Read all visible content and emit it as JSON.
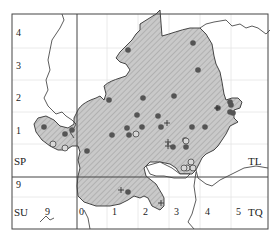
{
  "map": {
    "type": "distribution-map",
    "grid_squares": [
      "SP",
      "TL",
      "SU",
      "TQ"
    ],
    "square_labels": [
      {
        "text": "SP",
        "x": 14,
        "y": 165
      },
      {
        "text": "TL",
        "x": 248,
        "y": 165
      },
      {
        "text": "SU",
        "x": 14,
        "y": 216
      },
      {
        "text": "TQ",
        "x": 248,
        "y": 216
      }
    ],
    "y_ticks": [
      {
        "text": "4",
        "x": 16,
        "y": 37
      },
      {
        "text": "3",
        "x": 16,
        "y": 70
      },
      {
        "text": "2",
        "x": 16,
        "y": 102
      },
      {
        "text": "1",
        "x": 16,
        "y": 135
      },
      {
        "text": "9",
        "x": 16,
        "y": 189
      }
    ],
    "x_ticks": [
      {
        "text": "9",
        "x": 45,
        "y": 216
      },
      {
        "text": "0",
        "x": 79,
        "y": 216
      },
      {
        "text": "1",
        "x": 112,
        "y": 216
      },
      {
        "text": "2",
        "x": 143,
        "y": 216
      },
      {
        "text": "3",
        "x": 174,
        "y": 216
      },
      {
        "text": "4",
        "x": 205,
        "y": 216
      },
      {
        "text": "5",
        "x": 236,
        "y": 216
      }
    ],
    "colors": {
      "shaded_area": "#c8c8c8",
      "hatch": "#9a9a9a",
      "boundary": "#333333",
      "frame": "#444444",
      "grid": "#e2e2e2",
      "dot": "#555555"
    },
    "markers": {
      "filled_dots": [
        [
          128,
          50
        ],
        [
          193,
          43
        ],
        [
          198,
          70
        ],
        [
          44,
          127
        ],
        [
          65,
          134
        ],
        [
          72,
          130
        ],
        [
          127,
          128
        ],
        [
          129,
          135
        ],
        [
          112,
          135
        ],
        [
          87,
          151
        ],
        [
          174,
          96
        ],
        [
          142,
          127
        ],
        [
          158,
          116
        ],
        [
          161,
          127
        ],
        [
          192,
          127
        ],
        [
          205,
          127
        ],
        [
          230,
          102
        ],
        [
          231,
          105
        ],
        [
          230,
          112
        ],
        [
          143,
          98
        ],
        [
          137,
          115
        ],
        [
          173,
          147
        ],
        [
          185,
          140
        ],
        [
          186,
          147
        ],
        [
          128,
          192
        ],
        [
          109,
          100
        ],
        [
          218,
          108
        ],
        [
          233,
          113
        ]
      ],
      "open_circles": [
        [
          53,
          144
        ],
        [
          65,
          148
        ],
        [
          136,
          134
        ],
        [
          186,
          141
        ],
        [
          187,
          168
        ],
        [
          193,
          168
        ],
        [
          184,
          168
        ],
        [
          191,
          162
        ]
      ],
      "crosses": [
        [
          167,
          123
        ],
        [
          168,
          142
        ],
        [
          168,
          146
        ],
        [
          217,
          108
        ],
        [
          121,
          190
        ],
        [
          161,
          203
        ]
      ]
    }
  }
}
